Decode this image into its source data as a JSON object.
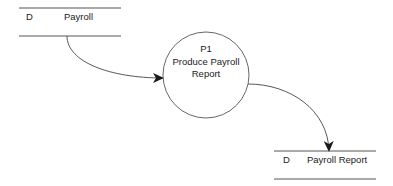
{
  "diagram": {
    "type": "data-flow-diagram",
    "data_stores": [
      {
        "id_label": "D",
        "name": "Payroll"
      },
      {
        "id_label": "D",
        "name": "Payroll Report"
      }
    ],
    "processes": [
      {
        "id": "P1",
        "name_line1": "Produce Payroll",
        "name_line2": "Report"
      }
    ],
    "flows": [
      {
        "from": "Payroll",
        "to": "P1"
      },
      {
        "from": "P1",
        "to": "Payroll Report"
      }
    ],
    "colors": {
      "stroke": "#333333",
      "text": "#1a1a1a",
      "background": "#ffffff"
    }
  }
}
